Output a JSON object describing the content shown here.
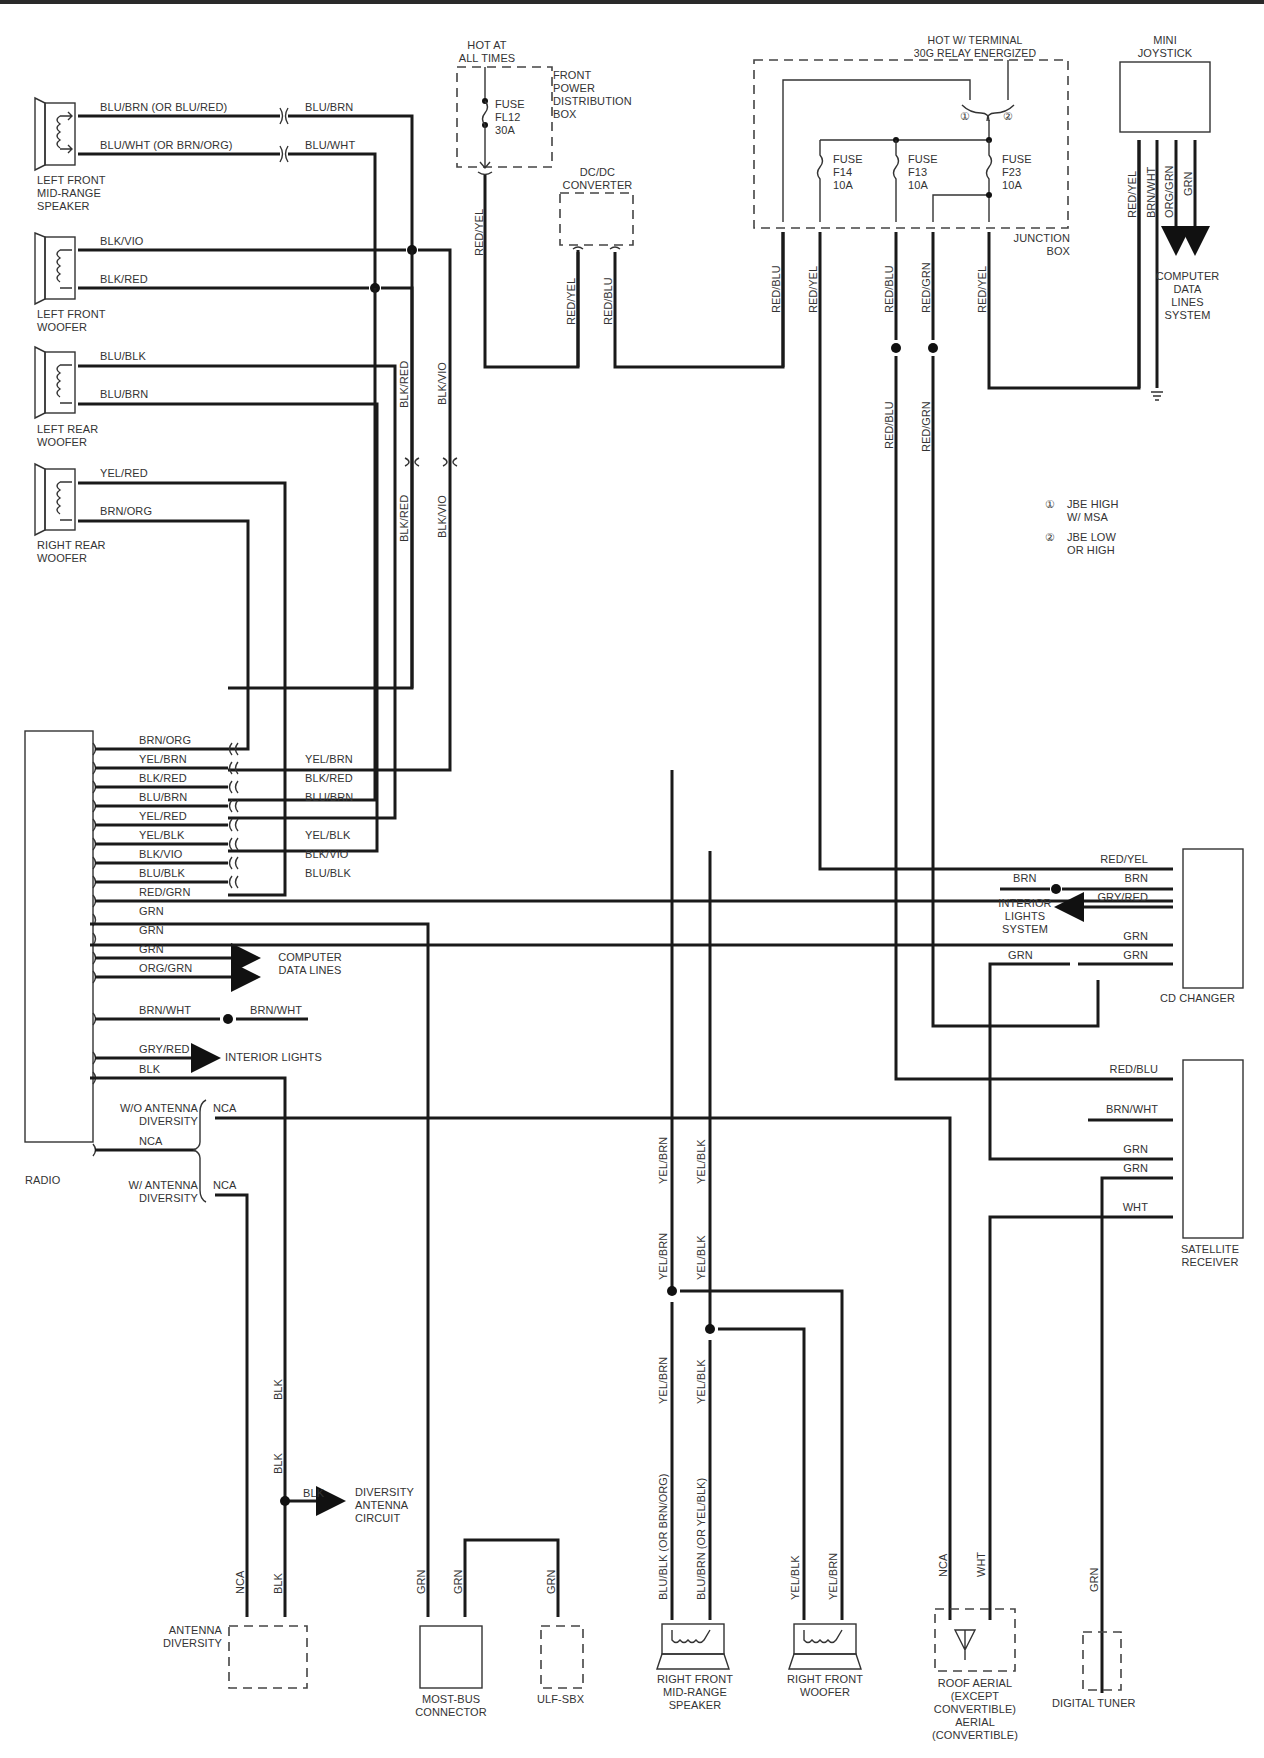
{
  "diagram": {
    "components": {
      "left_front_midrange": "LEFT FRONT\nMID-RANGE\nSPEAKER",
      "left_front_woofer": "LEFT FRONT\nWOOFER",
      "left_rear_woofer": "LEFT REAR\nWOOFER",
      "right_rear_woofer": "RIGHT REAR\nWOOFER",
      "radio": "RADIO",
      "front_power_box": "FRONT\nPOWER\nDISTRIBUTION\nBOX",
      "hot_at_all_times": "HOT AT\nALL TIMES",
      "fuse_fl12": "FUSE\nFL12\n30A",
      "dcdc": "DC/DC\nCONVERTER",
      "hot_w_terminal": "HOT W/ TERMINAL\n30G RELAY ENERGIZED",
      "fuse_f14": "FUSE\nF14\n10A",
      "fuse_f13": "FUSE\nF13\n10A",
      "fuse_f23": "FUSE\nF23\n10A",
      "junction_box": "JUNCTION\nBOX",
      "mini_joystick": "MINI\nJOYSTICK",
      "computer_data_lines_system": "COMPUTER\nDATA\nLINES\nSYSTEM",
      "cd_changer": "CD CHANGER",
      "interior_lights_system": "INTERIOR\nLIGHTS\nSYSTEM",
      "satellite_receiver": "SATELLITE\nRECEIVER",
      "computer_data_lines": "COMPUTER\nDATA LINES",
      "interior_lights": "INTERIOR LIGHTS",
      "wo_antenna_diversity": "W/O ANTENNA\nDIVERSITY",
      "w_antenna_diversity": "W/ ANTENNA\nDIVERSITY",
      "diversity_antenna_circuit": "DIVERSITY\nANTENNA\nCIRCUIT",
      "antenna_diversity": "ANTENNA\nDIVERSITY",
      "most_bus": "MOST-BUS\nCONNECTOR",
      "ulf_sbx": "ULF-SBX",
      "right_front_midrange": "RIGHT FRONT\nMID-RANGE\nSPEAKER",
      "right_front_woofer": "RIGHT FRONT\nWOOFER",
      "roof_aerial": "ROOF AERIAL\n(EXCEPT\nCONVERTIBLE)\nAERIAL\n(CONVERTIBLE)",
      "digital_tuner": "DIGITAL TUNER"
    },
    "legend": [
      {
        "num": "1",
        "text": "JBE HIGH\nW/ MSA"
      },
      {
        "num": "2",
        "text": "JBE LOW\nOR HIGH"
      }
    ],
    "wires": {
      "lf_mid_top_left": "BLU/BRN   (OR BLU/RED)",
      "lf_mid_top_right": "BLU/BRN",
      "lf_mid_bot_left": "BLU/WHT   (OR BRN/ORG)",
      "lf_mid_bot_right": "BLU/WHT",
      "lf_woof_top": "BLK/VIO",
      "lf_woof_bot": "BLK/RED",
      "lr_woof_top": "BLU/BLK",
      "lr_woof_bot": "BLU/BRN",
      "rr_woof_top": "YEL/RED",
      "rr_woof_bot": "BRN/ORG",
      "v_blkred_1": "BLK/RED",
      "v_blkvio_1": "BLK/VIO",
      "v_blkred_2": "BLK/RED",
      "v_blkvio_2": "BLK/VIO",
      "v_fl12": "RED/YEL",
      "v_dcdc_1": "RED/YEL",
      "v_dcdc_2": "RED/BLU",
      "v_jb_1": "RED/BLU",
      "v_jb_2": "RED/YEL",
      "v_jb_3": "RED/BLU",
      "v_jb_4": "RED/GRN",
      "v_jb_5": "RED/YEL",
      "v_jb_3b": "RED/BLU",
      "v_jb_4b": "RED/GRN",
      "v_joy_1": "RED/YEL",
      "v_joy_2": "BRN/WHT",
      "v_joy_3": "ORG/GRN",
      "v_joy_4": "GRN"
    },
    "radio_pins": [
      {
        "left": "BRN/ORG",
        "right": ""
      },
      {
        "left": "YEL/BRN",
        "right": "YEL/BRN"
      },
      {
        "left": "BLK/RED",
        "right": "BLK/RED"
      },
      {
        "left": "BLU/BRN",
        "right": "BLU/BRN"
      },
      {
        "left": "YEL/RED",
        "right": ""
      },
      {
        "left": "YEL/BLK",
        "right": "YEL/BLK"
      },
      {
        "left": "BLK/VIO",
        "right": "BLK/VIO"
      },
      {
        "left": "BLU/BLK",
        "right": "BLU/BLK"
      },
      {
        "left": "RED/GRN",
        "right": ""
      },
      {
        "left": "GRN",
        "right": ""
      },
      {
        "left": "GRN",
        "right": ""
      },
      {
        "left": "GRN",
        "right": ""
      },
      {
        "left": "ORG/GRN",
        "right": ""
      },
      {
        "left": "BRN/WHT",
        "right": "BRN/WHT"
      },
      {
        "left": "GRY/RED",
        "right": ""
      },
      {
        "left": "BLK",
        "right": ""
      },
      {
        "left": "NCA",
        "right": ""
      }
    ],
    "antenna_nca": {
      "wo": "NCA",
      "w": "NCA"
    },
    "cd_changer_pins": [
      "RED/YEL",
      "BRN",
      "GRY/RED",
      "GRN",
      "GRN"
    ],
    "cd_changer_extra": {
      "brn_left": "BRN",
      "grn_left": "GRN"
    },
    "sat_pins": [
      "RED/BLU",
      "BRN/WHT",
      "GRN",
      "GRN",
      "WHT"
    ],
    "lower_vertical": {
      "rf_mid_1a": "YEL/BRN",
      "rf_mid_2a": "YEL/BLK",
      "rf_mid_1b": "YEL/BRN",
      "rf_mid_2b": "YEL/BLK",
      "rf_mid_1c": "YEL/BRN",
      "rf_mid_2c": "YEL/BLK",
      "rf_mid_1d": "BLU/BLK   (OR BRN/ORG)",
      "rf_mid_2d": "BLU/BRN   (OR YEL/BLK)",
      "rf_woof_1": "YEL/BLK",
      "rf_woof_2": "YEL/BRN",
      "blk_1": "BLK",
      "blk_2": "BLK",
      "blk_3": "BLK",
      "blk_h": "BLK",
      "nca_ant": "NCA",
      "grn_most_1": "GRN",
      "grn_most_2": "GRN",
      "grn_ulf": "GRN",
      "roof_nca": "NCA",
      "roof_wht": "WHT",
      "dt_grn": "GRN"
    }
  }
}
